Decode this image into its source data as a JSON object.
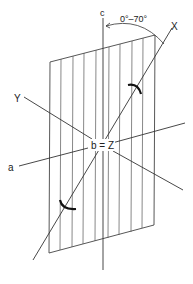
{
  "diagram": {
    "type": "crystallographic-axes",
    "labels": {
      "c_axis": "c",
      "x_axis": "X",
      "y_axis": "Y",
      "a_axis": "a",
      "center": "b = Z",
      "angle_range": "0°–70°"
    },
    "plane": {
      "shape": "parallelogram",
      "hatching": "vertical lines",
      "hatch_count": 10
    },
    "colors": {
      "line": "#333333",
      "background": "#ffffff"
    }
  }
}
